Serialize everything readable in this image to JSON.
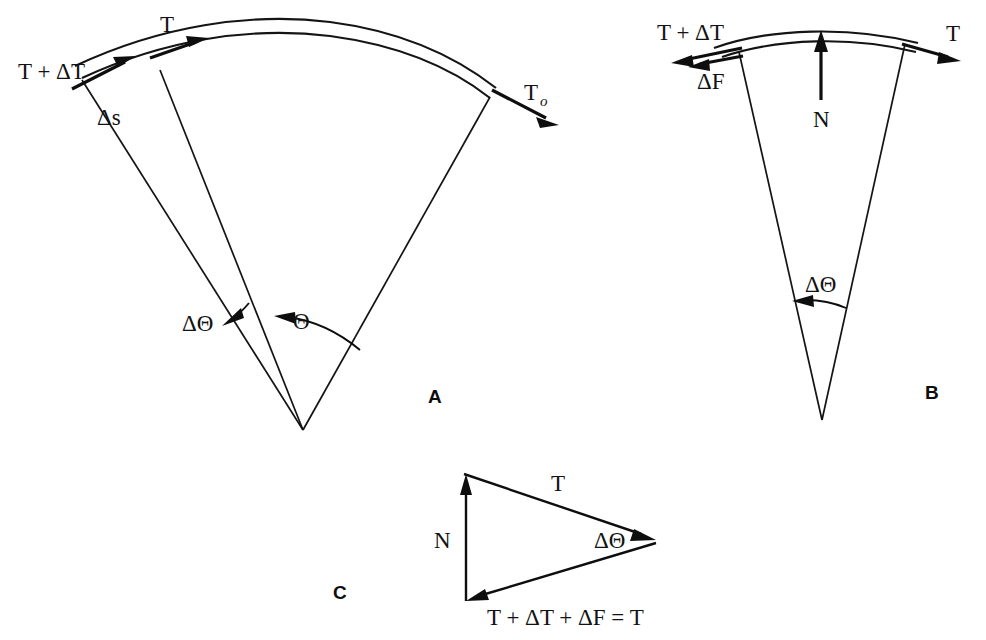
{
  "figure": {
    "background_color": "#ffffff",
    "ink_color": "#121212"
  },
  "panels": [
    {
      "id": "A",
      "letter": "A",
      "description": "Sector of a belt wrapped over a circular surface showing total wrap angle and an elemental angle",
      "labels": {
        "tension_in": "T + ΔT",
        "tension_element": "T",
        "tension_out": "T",
        "tension_out_sub": "o",
        "arc_length": "Δs",
        "delta_angle": "ΔΘ",
        "wrap_angle": "Θ"
      }
    },
    {
      "id": "B",
      "letter": "B",
      "description": "Free-body diagram of a single belt element showing tensions, friction force and normal force",
      "labels": {
        "tension_left": "T + ΔT",
        "friction": "ΔF",
        "normal": "N",
        "tension_right": "T",
        "delta_angle": "ΔΘ"
      }
    },
    {
      "id": "C",
      "letter": "C",
      "description": "Closed force triangle for the belt element",
      "labels": {
        "normal": "N",
        "tension": "T",
        "delta_angle": "ΔΘ",
        "equation": "T + ΔT + ΔF = T"
      }
    }
  ]
}
